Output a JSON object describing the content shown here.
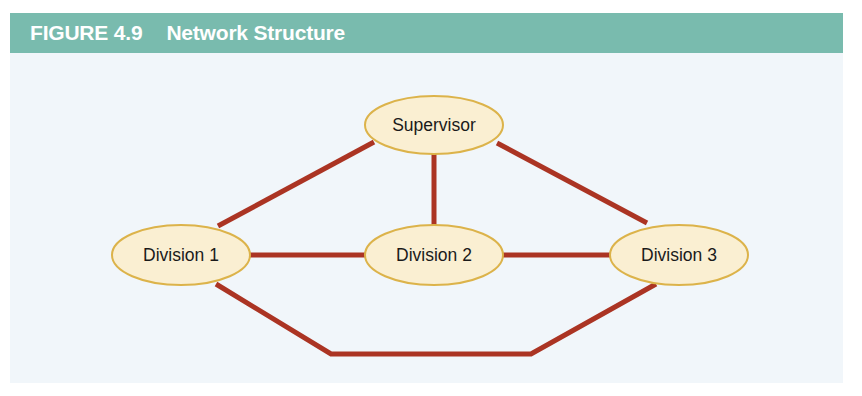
{
  "figure": {
    "number_label": "FIGURE 4.9",
    "title": "Network Structure",
    "header_bg": "#79bbae",
    "header_text_color": "#ffffff",
    "body_bg": "#f1f6fa"
  },
  "diagram": {
    "type": "network-diagram",
    "node_fill": "#faefd2",
    "node_stroke": "#dcb34a",
    "edge_color": "#ab3423",
    "edge_width": 5,
    "nodes": [
      {
        "id": "supervisor",
        "label": "Supervisor",
        "cx": 424,
        "cy": 72,
        "rx": 69,
        "ry": 29
      },
      {
        "id": "division1",
        "label": "Division 1",
        "cx": 171,
        "cy": 202,
        "rx": 69,
        "ry": 30
      },
      {
        "id": "division2",
        "label": "Division 2",
        "cx": 424,
        "cy": 202,
        "rx": 69,
        "ry": 30
      },
      {
        "id": "division3",
        "label": "Division 3",
        "cx": 669,
        "cy": 202,
        "rx": 69,
        "ry": 30
      }
    ],
    "edges": [
      {
        "id": "edge-supervisor-division1",
        "from": "supervisor",
        "to": "division1",
        "points": "364,89 208,173"
      },
      {
        "id": "edge-supervisor-division2",
        "from": "supervisor",
        "to": "division2",
        "points": "424,101 424,172"
      },
      {
        "id": "edge-supervisor-division3",
        "from": "supervisor",
        "to": "division3",
        "points": "487,90 637,170"
      },
      {
        "id": "edge-division1-division2",
        "from": "division1",
        "to": "division2",
        "points": "238,202 356,202"
      },
      {
        "id": "edge-division2-division3",
        "from": "division2",
        "to": "division3",
        "points": "492,202 602,202"
      },
      {
        "id": "edge-division1-division3",
        "from": "division1",
        "to": "division3",
        "points": "206,231 321,301 521,301 646,231"
      }
    ]
  }
}
